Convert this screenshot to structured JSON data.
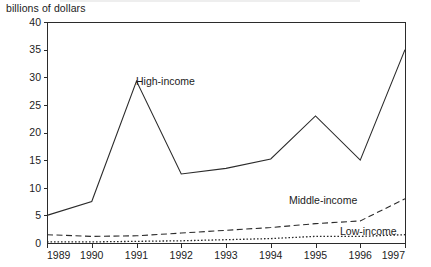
{
  "chart_data": {
    "type": "line",
    "title": "",
    "subtitle": "",
    "ylabel": "billions of dollars",
    "xlabel": "",
    "categories": [
      "1989",
      "1990",
      "1991",
      "1992",
      "1993",
      "1994",
      "1995",
      "1996",
      "1997"
    ],
    "x": [
      1989,
      1990,
      1991,
      1992,
      1993,
      1994,
      1995,
      1996,
      1997
    ],
    "xlim": [
      1989,
      1997
    ],
    "ylim": [
      0,
      40
    ],
    "y_ticks": [
      0,
      5,
      10,
      15,
      20,
      25,
      30,
      35,
      40
    ],
    "y_tick_labels": [
      "0",
      "5",
      "10",
      "15",
      "20",
      "25",
      "30",
      "35",
      "40"
    ],
    "grid": false,
    "legend": "inline-annotations",
    "series": [
      {
        "name": "High-income",
        "style": "solid",
        "color": "#2b2b2b",
        "values": [
          5.0,
          7.5,
          29.3,
          12.5,
          13.5,
          15.2,
          23.0,
          15.0,
          35.0
        ]
      },
      {
        "name": "Middle-income",
        "style": "dashed",
        "color": "#2b2b2b",
        "values": [
          1.5,
          1.2,
          1.3,
          1.8,
          2.3,
          2.8,
          3.5,
          4.0,
          8.0
        ]
      },
      {
        "name": "Low-income",
        "style": "dotted",
        "color": "#2b2b2b",
        "values": [
          0.2,
          0.2,
          0.3,
          0.4,
          0.6,
          0.8,
          1.2,
          1.2,
          1.5
        ]
      }
    ],
    "annotations": [
      {
        "text": "High-income",
        "x_px": 136,
        "y_px": 85
      },
      {
        "text": "Middle-income",
        "x_px": 289,
        "y_px": 204
      },
      {
        "text": "Low-income",
        "x_px": 340,
        "y_px": 235
      }
    ]
  },
  "axis": {
    "y_title": "billions of dollars"
  }
}
